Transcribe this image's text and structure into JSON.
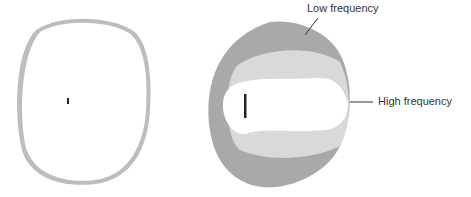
{
  "diagram": {
    "left_panel": {
      "name": "omnidirectional-pattern",
      "colors": {
        "outer_band": "#bdbdbd",
        "inner_fill": "#ffffff",
        "source": "#222222"
      }
    },
    "right_panel": {
      "name": "frequency-dependent-pattern",
      "labels": {
        "low": "Low frequency",
        "high": "High frequency"
      },
      "colors": {
        "low_region": "#a9a9a9",
        "mid_region": "#d9d9d9",
        "high_region": "#ffffff",
        "source": "#222222",
        "leader": "#333333"
      }
    }
  }
}
